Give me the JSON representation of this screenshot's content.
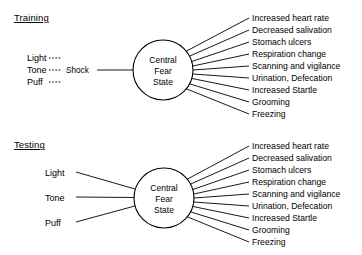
{
  "figure": {
    "background_color": "#ffffff",
    "line_color": "#000000",
    "text_color": "#000000"
  },
  "sections": [
    {
      "id": "training",
      "heading": "Training",
      "node": {
        "line1": "Central",
        "line2": "Fear",
        "line3": "State"
      },
      "inputs": [
        {
          "label": "Light",
          "connector": "dashed"
        },
        {
          "label": "Tone",
          "connector": "dashed"
        },
        {
          "label": "Puff",
          "connector": "dashed"
        }
      ],
      "mediator": {
        "label": "Shock",
        "connector": "solid"
      },
      "outputs": [
        "Increased heart rate",
        "Decreased salivation",
        "Stomach ulcers",
        "Respiration change",
        "Scanning and vigilance",
        "Urination,  Defecation",
        "Increased Startle",
        "Grooming",
        "Freezing"
      ]
    },
    {
      "id": "testing",
      "heading": "Testing",
      "node": {
        "line1": "Central",
        "line2": "Fear",
        "line3": "State"
      },
      "inputs": [
        {
          "label": "Light",
          "connector": "solid"
        },
        {
          "label": "Tone",
          "connector": "solid"
        },
        {
          "label": "Puff",
          "connector": "solid"
        }
      ],
      "mediator": null,
      "outputs": [
        "Increased heart rate",
        "Decreased salivation",
        "Stomach ulcers",
        "Respiration change",
        "Scanning and vigilance",
        "Urination,  Defecation",
        "Increased Startle",
        "Grooming",
        "Freezing"
      ]
    }
  ]
}
